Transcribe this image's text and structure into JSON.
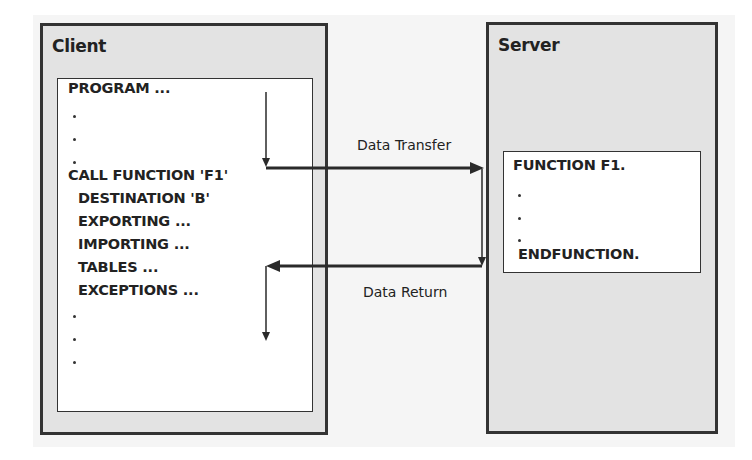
{
  "diagram": {
    "client": {
      "title": "Client",
      "code_lines": [
        "PROGRAM ...",
        "CALL FUNCTION 'F1'",
        "DESTINATION 'B'",
        "EXPORTING ...",
        "IMPORTING ...",
        "TABLES ...",
        "EXCEPTIONS ..."
      ]
    },
    "server": {
      "title": "Server",
      "code_lines": [
        "FUNCTION F1.",
        "ENDFUNCTION."
      ]
    },
    "flows": {
      "transfer_label": "Data Transfer",
      "return_label": "Data Return"
    },
    "colors": {
      "panel_fill": "#e3e3e3",
      "panel_border": "#333333",
      "code_box_fill": "#ffffff",
      "arrow": "#2a2a2a"
    }
  }
}
